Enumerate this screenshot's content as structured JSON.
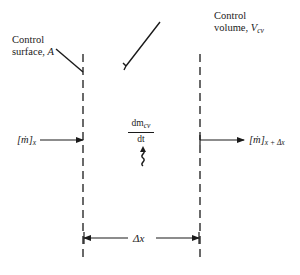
{
  "diagram": {
    "type": "control-volume-mass-balance",
    "labels": {
      "control_surface_line1": "Control",
      "control_surface_line2": "surface, ",
      "control_surface_symbol": "A",
      "control_volume_line1": "Control",
      "control_volume_line2": "volume, ",
      "control_volume_symbol": "V",
      "control_volume_subscript": "cv",
      "inflow_symbol": "[ṁ]",
      "inflow_subscript": "x",
      "outflow_symbol": "[ṁ]",
      "outflow_subscript": "x + Δx",
      "rate_numerator": "dm",
      "rate_numerator_subscript": "cv",
      "rate_denominator": "dt",
      "width_label": "Δx"
    },
    "colors": {
      "stroke": "#1a1a1a",
      "background": "#ffffff"
    }
  }
}
